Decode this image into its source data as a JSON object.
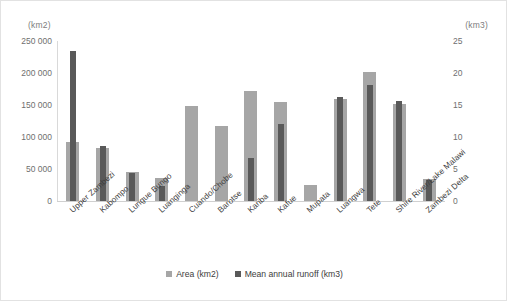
{
  "chart_data": {
    "type": "bar",
    "title": "",
    "subtitle": "",
    "xlabel": "",
    "ylabel": "(km2)",
    "y2label": "(km3)",
    "grid": false,
    "legend_position": "bottom",
    "categories": [
      "Upper Zambezi",
      "Kabompo",
      "Lungue Bungo",
      "Luanginga",
      "Cuando/Chobe",
      "Barotse",
      "Kariba",
      "Kafue",
      "Mupata",
      "Luangwa",
      "Tete",
      "Shire River/Lake Malawi",
      "Zambezi Delta"
    ],
    "series": [
      {
        "name": "Area (km2)",
        "axis": "left",
        "color": "#a6a6a6",
        "values": [
          92000,
          83000,
          45000,
          36000,
          148000,
          117000,
          172000,
          155000,
          25000,
          160000,
          202000,
          152000,
          35000
        ]
      },
      {
        "name": "Mean annual runoff (km3)",
        "axis": "right",
        "color": "#595959",
        "values": [
          23.5,
          8.6,
          4.3,
          2.3,
          0,
          0,
          6.7,
          12.0,
          0,
          16.3,
          18.2,
          15.7,
          3.3
        ]
      }
    ],
    "ylim": [
      0,
      250000
    ],
    "y2lim": [
      0,
      25
    ],
    "yticks": [
      0,
      50000,
      100000,
      150000,
      200000,
      250000
    ],
    "ytick_labels": [
      "0",
      "50 000",
      "100 000",
      "150 000",
      "200 000",
      "250 000"
    ],
    "y2ticks": [
      0,
      5,
      10,
      15,
      20,
      25
    ],
    "y2tick_labels": [
      "0",
      "5",
      "10",
      "15",
      "20",
      "25"
    ]
  },
  "legend": {
    "items": [
      {
        "label": "Area (km2)",
        "color": "#a6a6a6"
      },
      {
        "label": "Mean annual runoff (km3)",
        "color": "#595959"
      }
    ]
  }
}
